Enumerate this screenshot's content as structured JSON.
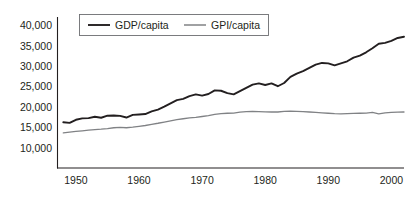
{
  "chart_data": {
    "type": "line",
    "title": "",
    "xlabel": "",
    "ylabel": "",
    "xlim": [
      1947,
      2002
    ],
    "ylim": [
      7500,
      41500
    ],
    "grid": false,
    "legend_position": "top-center",
    "y_ticks": [
      10000,
      15000,
      20000,
      25000,
      30000,
      35000,
      40000
    ],
    "y_tick_labels": [
      "10,000",
      "15,000",
      "20,000",
      "25,000",
      "30,000",
      "35,000",
      "40,000"
    ],
    "x_ticks": [
      1950,
      1960,
      1970,
      1980,
      1990,
      2000
    ],
    "x_tick_labels": [
      "1950",
      "1960",
      "1970",
      "1980",
      "1990",
      "2000"
    ],
    "x": [
      1948,
      1949,
      1950,
      1951,
      1952,
      1953,
      1954,
      1955,
      1956,
      1957,
      1958,
      1959,
      1960,
      1961,
      1962,
      1963,
      1964,
      1965,
      1966,
      1967,
      1968,
      1969,
      1970,
      1971,
      1972,
      1973,
      1974,
      1975,
      1976,
      1977,
      1978,
      1979,
      1980,
      1981,
      1982,
      1983,
      1984,
      1985,
      1986,
      1987,
      1988,
      1989,
      1990,
      1991,
      1992,
      1993,
      1994,
      1995,
      1996,
      1997,
      1998,
      1999,
      2000,
      2001,
      2002
    ],
    "series": [
      {
        "name": "GDP/capita",
        "color": "#231f20",
        "width": 1.9,
        "values": [
          16300,
          16150,
          16900,
          17250,
          17300,
          17650,
          17400,
          17900,
          17950,
          17850,
          17450,
          18100,
          18200,
          18300,
          18950,
          19400,
          20100,
          20900,
          21700,
          22000,
          22700,
          23100,
          22800,
          23200,
          24100,
          24000,
          23400,
          23100,
          23900,
          24700,
          25500,
          25800,
          25400,
          25800,
          25100,
          25900,
          27400,
          28200,
          28800,
          29600,
          30400,
          30800,
          30700,
          30200,
          30700,
          31200,
          32100,
          32600,
          33400,
          34400,
          35500,
          35700,
          36200,
          36900,
          37200
        ]
      },
      {
        "name": "GPI/capita",
        "color": "#808285",
        "width": 1.3,
        "values": [
          13700,
          13900,
          14050,
          14200,
          14350,
          14500,
          14600,
          14750,
          14950,
          15050,
          14950,
          15100,
          15300,
          15500,
          15800,
          16050,
          16350,
          16650,
          16950,
          17150,
          17350,
          17500,
          17700,
          17900,
          18200,
          18400,
          18500,
          18550,
          18750,
          18900,
          18950,
          18900,
          18850,
          18800,
          18800,
          18950,
          19000,
          18950,
          18900,
          18800,
          18700,
          18600,
          18500,
          18400,
          18350,
          18400,
          18450,
          18500,
          18550,
          18700,
          18350,
          18600,
          18700,
          18750,
          18800
        ]
      }
    ]
  },
  "legend": {
    "entries": [
      {
        "label": "GDP/capita"
      },
      {
        "label": "GPI/capita"
      }
    ]
  }
}
